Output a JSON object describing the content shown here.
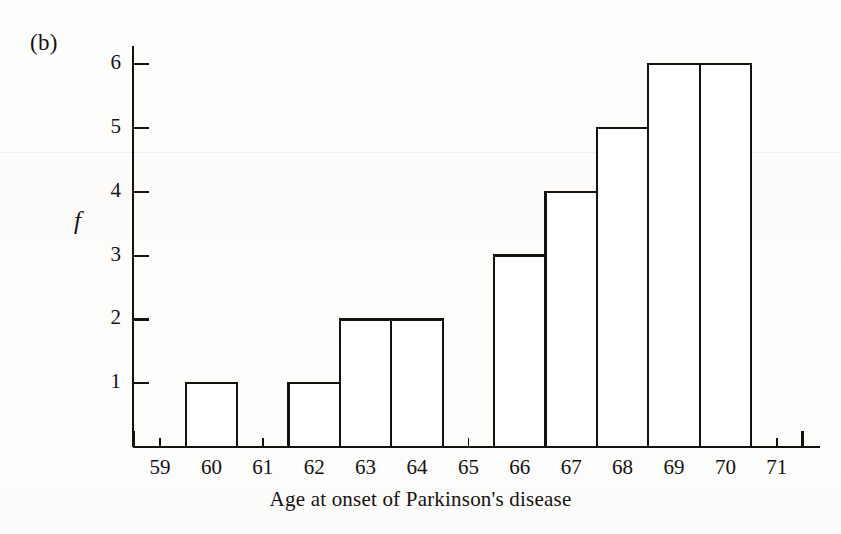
{
  "figure": {
    "panel_label": "(b)",
    "x_axis_caption": "Age at onset of Parkinson's disease",
    "y_axis_label": "f"
  },
  "chart_data": {
    "type": "bar",
    "title": "",
    "subtitle": "",
    "xlabel": "Age at onset of Parkinson's disease",
    "ylabel": "f",
    "panel": "(b)",
    "categories": [
      59,
      60,
      61,
      62,
      63,
      64,
      65,
      66,
      67,
      68,
      69,
      70,
      71
    ],
    "values": [
      0,
      1,
      0,
      1,
      2,
      2,
      0,
      3,
      4,
      5,
      6,
      6,
      0
    ],
    "bin_width": 1,
    "bin_edges": [
      58.5,
      59.5,
      60.5,
      61.5,
      62.5,
      63.5,
      64.5,
      65.5,
      66.5,
      67.5,
      68.5,
      69.5,
      70.5,
      71.5
    ],
    "x_tick_labels": [
      "59",
      "60",
      "61",
      "62",
      "63",
      "64",
      "65",
      "66",
      "67",
      "68",
      "69",
      "70",
      "71"
    ],
    "y_tick_labels": [
      "1",
      "2",
      "3",
      "4",
      "5",
      "6"
    ],
    "y_ticks": [
      1,
      2,
      3,
      4,
      5,
      6
    ],
    "xlim": [
      58.5,
      71.9
    ],
    "ylim": [
      0,
      6.6
    ],
    "grid": false,
    "legend": null,
    "bar_fill": "#ffffff",
    "bar_stroke": "#15110f",
    "axis_color": "#15110f",
    "background": "#fdfdfc",
    "total_count": 30
  }
}
